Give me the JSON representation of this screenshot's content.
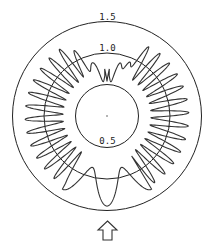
{
  "chart_data": {
    "type": "polar-line",
    "title": "",
    "rings": [
      {
        "value": 0.5,
        "label": "0.5",
        "label_position": "bottom"
      },
      {
        "value": 1.0,
        "label": "1.0",
        "label_position": "top"
      },
      {
        "value": 1.5,
        "label": "1.5",
        "label_position": "top"
      }
    ],
    "radial_range": [
      0,
      1.5
    ],
    "grid": true,
    "series": [
      {
        "name": "radiation pattern",
        "description": "oscillating radial response approx 0.7-1.3 around the circle, ~38 lobes; deep narrow notch near top (dips to ~0.55), broad low-frequency lobes near bottom reaching ~1.45",
        "lobes": 38,
        "mean": 1.0,
        "amplitude": 0.3,
        "top_notch_min": 0.55,
        "bottom_peak": 1.45
      }
    ],
    "annotations": [
      {
        "type": "arrow",
        "direction": "up",
        "position": "below plot, bottom center"
      }
    ]
  },
  "style": {
    "line_color": "#333333",
    "ring_color": "#222222"
  }
}
